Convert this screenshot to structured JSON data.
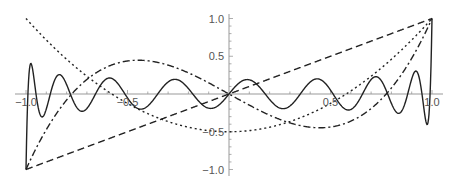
{
  "chart_data": {
    "type": "line",
    "title": "",
    "xlabel": "",
    "ylabel": "",
    "xlim": [
      -1.0,
      1.0
    ],
    "ylim": [
      -1.0,
      1.0
    ],
    "grid": false,
    "legend": null,
    "x_ticks": [
      {
        "value": -1.0,
        "label": "-1.0"
      },
      {
        "value": -0.5,
        "label": "-0.5"
      },
      {
        "value": 0.5,
        "label": "0.5"
      },
      {
        "value": 1.0,
        "label": "1.0"
      }
    ],
    "y_ticks": [
      {
        "value": 1.0,
        "label": "1.0"
      },
      {
        "value": 0.5,
        "label": "0.5"
      },
      {
        "value": -0.5,
        "label": "-0.5"
      },
      {
        "value": -1.0,
        "label": "-1.0"
      }
    ],
    "x": [
      -1.0,
      -0.75,
      -0.5,
      -0.25,
      0.0,
      0.25,
      0.5,
      0.75,
      1.0
    ],
    "series": [
      {
        "name": "P1 (dashed)",
        "style": "dashed",
        "legendre_degree": 1,
        "values": [
          -1.0,
          -0.75,
          -0.5,
          -0.25,
          0.0,
          0.25,
          0.5,
          0.75,
          1.0
        ]
      },
      {
        "name": "P2 (dotted)",
        "style": "dotted",
        "legendre_degree": 2,
        "values": [
          1.0,
          0.344,
          -0.125,
          -0.406,
          -0.5,
          -0.406,
          -0.125,
          0.344,
          1.0
        ]
      },
      {
        "name": "P3 (dash-dot)",
        "style": "dashdot",
        "legendre_degree": 3,
        "values": [
          -1.0,
          0.07,
          0.438,
          0.336,
          0.0,
          -0.336,
          -0.438,
          -0.07,
          1.0
        ]
      },
      {
        "name": "P17 (solid)",
        "style": "solid",
        "legendre_degree": 17,
        "values": [
          -1.0,
          -0.05,
          -0.15,
          0.19,
          0.0,
          -0.19,
          0.15,
          0.05,
          1.0
        ]
      }
    ],
    "colors": {
      "curves": "#222222",
      "axes": "#999999",
      "tick_labels": "#555555"
    }
  }
}
